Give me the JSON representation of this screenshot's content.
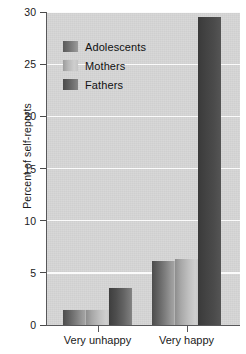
{
  "chart_data": {
    "type": "bar",
    "title": "",
    "subtitle": "",
    "xlabel": "",
    "ylabel": "Percent of self-reports",
    "categories": [
      "Very unhappy",
      "Very happy"
    ],
    "series": [
      {
        "name": "Adolescents",
        "values": [
          1.4,
          6.1
        ],
        "color": "#7f7f7f"
      },
      {
        "name": "Mothers",
        "values": [
          1.4,
          6.3
        ],
        "color": "#c0c0c0"
      },
      {
        "name": "Fathers",
        "values": [
          3.5,
          29.5
        ],
        "color": "#4d4d4d"
      }
    ],
    "ylim": [
      0,
      30
    ],
    "yticks": [
      0,
      5,
      10,
      15,
      20,
      25,
      30
    ],
    "ytick_labels": [
      "0",
      "5",
      "10",
      "15",
      "20",
      "25",
      "30"
    ],
    "grid": true,
    "grid_axis": "y",
    "grid_color": "#fbfbfb",
    "plot_background": "#d7d7d7",
    "figure_background": "#ffffff",
    "legend_position": "upper left",
    "legend_entries": [
      "Adolescents",
      "Mothers",
      "Fathers"
    ]
  },
  "axes": {
    "y_title": "Percent of self-reports",
    "y_ticks": [
      {
        "label": "30",
        "value": 30
      },
      {
        "label": "25",
        "value": 25
      },
      {
        "label": "20",
        "value": 20
      },
      {
        "label": "15",
        "value": 15
      },
      {
        "label": "10",
        "value": 10
      },
      {
        "label": "5",
        "value": 5
      },
      {
        "label": "0",
        "value": 0
      }
    ],
    "x_ticks": [
      {
        "label": "Very unhappy"
      },
      {
        "label": "Very happy"
      }
    ]
  },
  "legend": {
    "items": [
      {
        "label": "Adolescents",
        "swatch": "adolescents"
      },
      {
        "label": "Mothers",
        "swatch": "mothers"
      },
      {
        "label": "Fathers",
        "swatch": "fathers"
      }
    ]
  }
}
